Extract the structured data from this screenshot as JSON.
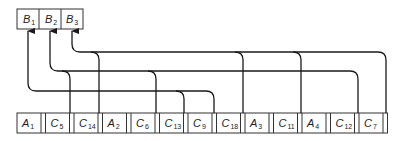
{
  "diagram": {
    "type": "hash-chain-linked-list",
    "top_array": {
      "cells": [
        {
          "label": "B",
          "sub": "1"
        },
        {
          "label": "B",
          "sub": "2"
        },
        {
          "label": "B",
          "sub": "3"
        }
      ]
    },
    "bottom_array": {
      "cells": [
        {
          "label": "A",
          "sub": "1"
        },
        {
          "label": "C",
          "sub": "5"
        },
        {
          "label": "C",
          "sub": "14"
        },
        {
          "label": "A",
          "sub": "2"
        },
        {
          "label": "C",
          "sub": "6"
        },
        {
          "label": "C",
          "sub": "13"
        },
        {
          "label": "C",
          "sub": "9"
        },
        {
          "label": "C",
          "sub": "18"
        },
        {
          "label": "A",
          "sub": "3"
        },
        {
          "label": "C",
          "sub": "11"
        },
        {
          "label": "A",
          "sub": "4"
        },
        {
          "label": "C",
          "sub": "12"
        },
        {
          "label": "C",
          "sub": "7"
        }
      ]
    },
    "chains": [
      {
        "head": "B1",
        "links_from": [
          "C13",
          "C9"
        ]
      },
      {
        "head": "B2",
        "links_from": [
          "C5",
          "C6",
          "C12"
        ]
      },
      {
        "head": "B3",
        "links_from": [
          "C14",
          "C18",
          "C11",
          "C7"
        ]
      }
    ],
    "colors": {
      "line": "#1a1a1a",
      "box_border": "#333333",
      "background": "#ffffff"
    }
  }
}
